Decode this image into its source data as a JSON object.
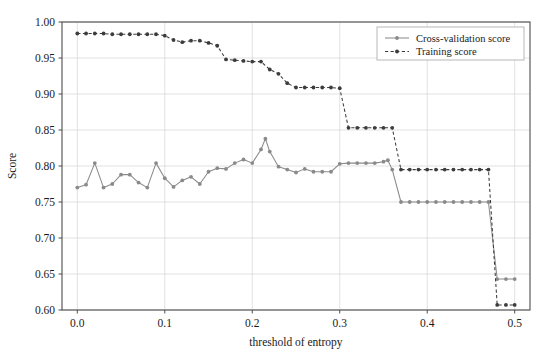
{
  "chart_data": {
    "type": "line",
    "title": "",
    "xlabel": "threshold of entropy",
    "ylabel": "Score",
    "xlim": [
      -0.0175,
      0.5175
    ],
    "ylim": [
      0.6,
      1.0
    ],
    "xticks": [
      0.0,
      0.1,
      0.2,
      0.3,
      0.4,
      0.5
    ],
    "xtick_labels": [
      "0.0",
      "0.1",
      "0.2",
      "0.3",
      "0.4",
      "0.5"
    ],
    "yticks": [
      0.6,
      0.65,
      0.7,
      0.75,
      0.8,
      0.85,
      0.9,
      0.95,
      1.0
    ],
    "ytick_labels": [
      "0.60",
      "0.65",
      "0.70",
      "0.75",
      "0.80",
      "0.85",
      "0.90",
      "0.95",
      "1.00"
    ],
    "grid": true,
    "grid_color": "#d9d9d9",
    "legend_position": "upper right",
    "series": [
      {
        "name": "Cross-validation score",
        "color": "#8a8a8a",
        "linestyle": "solid",
        "marker": "circle",
        "x": [
          0.0,
          0.01,
          0.02,
          0.03,
          0.04,
          0.05,
          0.06,
          0.07,
          0.08,
          0.09,
          0.1,
          0.11,
          0.12,
          0.13,
          0.14,
          0.15,
          0.16,
          0.17,
          0.18,
          0.19,
          0.2,
          0.21,
          0.215,
          0.22,
          0.23,
          0.24,
          0.25,
          0.26,
          0.27,
          0.28,
          0.29,
          0.3,
          0.31,
          0.32,
          0.33,
          0.34,
          0.35,
          0.355,
          0.36,
          0.37,
          0.38,
          0.39,
          0.4,
          0.41,
          0.42,
          0.43,
          0.44,
          0.45,
          0.46,
          0.47,
          0.48,
          0.49,
          0.5
        ],
        "y": [
          0.77,
          0.774,
          0.804,
          0.77,
          0.775,
          0.788,
          0.788,
          0.777,
          0.77,
          0.804,
          0.783,
          0.771,
          0.78,
          0.785,
          0.775,
          0.792,
          0.797,
          0.796,
          0.804,
          0.809,
          0.804,
          0.823,
          0.838,
          0.82,
          0.799,
          0.795,
          0.791,
          0.796,
          0.792,
          0.792,
          0.792,
          0.803,
          0.804,
          0.804,
          0.804,
          0.804,
          0.806,
          0.808,
          0.795,
          0.75,
          0.75,
          0.75,
          0.75,
          0.75,
          0.75,
          0.75,
          0.75,
          0.75,
          0.75,
          0.75,
          0.643,
          0.643,
          0.643
        ]
      },
      {
        "name": "Training score",
        "color": "#3c3c3c",
        "linestyle": "dashed",
        "marker": "circle",
        "x": [
          0.0,
          0.01,
          0.02,
          0.03,
          0.04,
          0.05,
          0.06,
          0.07,
          0.08,
          0.09,
          0.1,
          0.11,
          0.12,
          0.13,
          0.14,
          0.15,
          0.16,
          0.17,
          0.18,
          0.19,
          0.2,
          0.21,
          0.22,
          0.23,
          0.24,
          0.25,
          0.26,
          0.27,
          0.28,
          0.29,
          0.3,
          0.31,
          0.32,
          0.33,
          0.34,
          0.35,
          0.36,
          0.37,
          0.38,
          0.39,
          0.4,
          0.41,
          0.42,
          0.43,
          0.44,
          0.45,
          0.46,
          0.47,
          0.48,
          0.49,
          0.5
        ],
        "y": [
          0.984,
          0.984,
          0.984,
          0.984,
          0.983,
          0.983,
          0.983,
          0.983,
          0.983,
          0.983,
          0.981,
          0.975,
          0.972,
          0.974,
          0.974,
          0.971,
          0.967,
          0.948,
          0.947,
          0.946,
          0.945,
          0.945,
          0.934,
          0.928,
          0.915,
          0.909,
          0.909,
          0.909,
          0.909,
          0.909,
          0.908,
          0.853,
          0.853,
          0.853,
          0.853,
          0.853,
          0.853,
          0.795,
          0.795,
          0.795,
          0.795,
          0.795,
          0.795,
          0.795,
          0.795,
          0.795,
          0.795,
          0.795,
          0.607,
          0.607,
          0.607
        ]
      }
    ]
  },
  "legend": {
    "entries": [
      {
        "label": "Cross-validation score"
      },
      {
        "label": "Training score"
      }
    ]
  },
  "axes": {
    "xlabel": "threshold of entropy",
    "ylabel": "Score"
  },
  "colors": {
    "cv_series": "#8a8a8a",
    "training_series": "#3c3c3c",
    "grid": "#d9d9d9",
    "axis": "#4d4d4d",
    "background": "#ffffff"
  }
}
